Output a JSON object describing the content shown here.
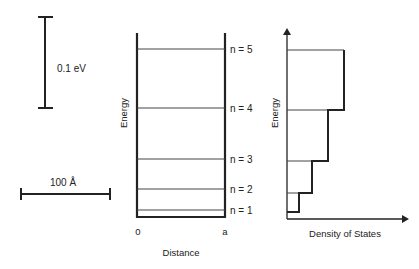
{
  "scale_bars": {
    "energy": {
      "label": "0.1 eV"
    },
    "length": {
      "label": "100 Å"
    }
  },
  "well_panel": {
    "y_axis_label": "Energy",
    "x_axis_label": "Distance",
    "x_ticks": [
      "0",
      "a"
    ],
    "levels": [
      {
        "label": "n = 1",
        "y": 210
      },
      {
        "label": "n = 2",
        "y": 189
      },
      {
        "label": "n = 3",
        "y": 159
      },
      {
        "label": "n = 4",
        "y": 108
      },
      {
        "label": "n = 5",
        "y": 49
      }
    ]
  },
  "dos_panel": {
    "y_axis_label": "Energy",
    "x_axis_label": "Density of States",
    "steps": [
      {
        "n": 1,
        "y": 212,
        "x_right": 299
      },
      {
        "n": 2,
        "y": 193,
        "x_right": 312
      },
      {
        "n": 3,
        "y": 161,
        "x_right": 328
      },
      {
        "n": 4,
        "y": 110,
        "x_right": 344
      },
      {
        "n": 5,
        "y": 50,
        "x_right": 344
      }
    ]
  },
  "colors": {
    "line": "#222222",
    "thin": "#444444"
  }
}
